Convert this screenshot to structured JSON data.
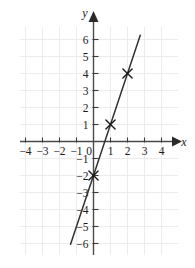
{
  "chart_data": {
    "type": "line",
    "title": "",
    "xlabel": "x",
    "ylabel": "y",
    "grid": true,
    "legend": "none",
    "xlim": [
      -4.6,
      4.8
    ],
    "ylim": [
      -6.6,
      6.6
    ],
    "xticks": [
      -4,
      -3,
      -2,
      -1,
      0,
      1,
      2,
      3,
      4
    ],
    "yticks": [
      6,
      5,
      4,
      3,
      2,
      1,
      -1,
      -2,
      -3,
      -4,
      -5,
      -6
    ],
    "xtick_labels": [
      "−4",
      "−3",
      "−2",
      "−1",
      "0",
      "1",
      "2",
      "3",
      "4"
    ],
    "ytick_labels": [
      "6",
      "5",
      "4",
      "3",
      "2",
      "1",
      "−1",
      "−2",
      "−3",
      "−4",
      "−5",
      "−6"
    ],
    "series": [
      {
        "name": "y = 3x - 2",
        "type": "line",
        "slope": 3,
        "intercept": -2,
        "x": [
          -1.35,
          2.75
        ],
        "y": [
          -6.05,
          6.25
        ],
        "color": "#333333"
      }
    ],
    "marked_points": [
      {
        "label": "(0, -2)",
        "x": 0,
        "y": -2,
        "marker": "x"
      },
      {
        "label": "(1, 1)",
        "x": 1,
        "y": 1,
        "marker": "x"
      },
      {
        "label": "(2, 4)",
        "x": 2,
        "y": 4,
        "marker": "x"
      }
    ],
    "colors": {
      "grid": "#ececec",
      "axis": "#444444",
      "line": "#333333",
      "marker": "#1a1a1a",
      "text": "#1a1a1a",
      "background": "#ffffff"
    }
  },
  "axes": {
    "x_axis_name": "x",
    "y_axis_name": "y"
  }
}
